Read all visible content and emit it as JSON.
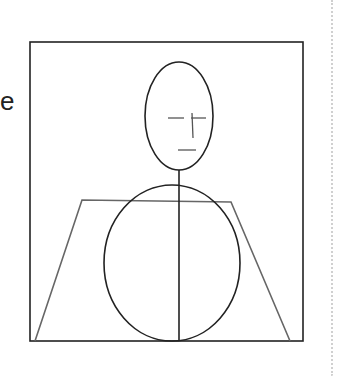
{
  "text": {
    "partial_label": "e"
  },
  "figure": {
    "frame": {
      "x": 30,
      "y": 42,
      "width": 273,
      "height": 299,
      "stroke": "#222222"
    },
    "trapezoid": {
      "points": "35,341 82,200 231,202 290,341",
      "stroke": "#666666"
    },
    "head": {
      "cx": 179,
      "cy": 116,
      "rx": 34,
      "ry": 54,
      "stroke": "#222222"
    },
    "body": {
      "cx": 172,
      "cy": 263,
      "rx": 68,
      "ry": 78,
      "stroke": "#222222"
    },
    "spine": {
      "x": 179,
      "y1": 170,
      "y2": 341
    },
    "face": {
      "left_eye": {
        "x1": 168,
        "y1": 118,
        "x2": 184,
        "y2": 118
      },
      "right_eye": {
        "x1": 191,
        "y1": 118,
        "x2": 206,
        "y2": 118
      },
      "nose": {
        "x1": 192,
        "y1": 113,
        "x2": 193,
        "y2": 138
      },
      "mouth": {
        "x1": 178,
        "y1": 150,
        "x2": 196,
        "y2": 150
      },
      "stroke": "#555555"
    }
  }
}
